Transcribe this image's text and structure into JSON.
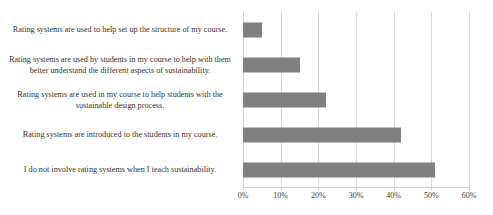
{
  "chart_data": {
    "type": "bar",
    "orientation": "horizontal",
    "title": "",
    "xlabel": "",
    "ylabel": "",
    "categories": [
      "Rating systems are used to help set up the structure of my course.",
      "Rating systems are used by students in my course to help with them better understand the different aspects of sustainability.",
      "Rating systems are used in my course to help students with the sustainable design process.",
      "Rating systems are introduced to the students in my course.",
      "I do not involve rating systems when I teach sustainability."
    ],
    "values": [
      5,
      15,
      22,
      42,
      51
    ],
    "xlim": [
      0,
      60
    ],
    "xticks": [
      0,
      10,
      20,
      30,
      40,
      50,
      60
    ],
    "xtick_labels": [
      "0%",
      "10%",
      "20%",
      "30%",
      "40%",
      "50%",
      "60%"
    ],
    "grid": true,
    "legend": false,
    "bar_color": "#808080",
    "grid_color": "#d9d9d9",
    "axis_color": "#d0d0d0",
    "text_color": "#333333"
  }
}
